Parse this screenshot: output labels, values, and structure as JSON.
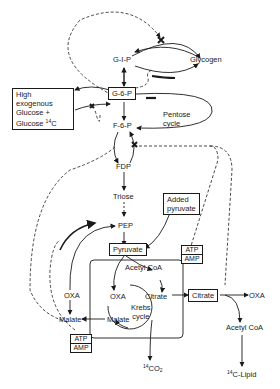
{
  "diagram": {
    "title": "",
    "nodes": {
      "g1p": "G-I-P",
      "glycogen": "Glycogen",
      "g6p": "G-6-P",
      "glucose_box": [
        "High exogenous",
        "Glucose +",
        "Glucose"
      ],
      "glucose_isotope": "14",
      "glucose_isotope_suffix": "C",
      "pentose": [
        "Pentose",
        "cycle"
      ],
      "f6p": "F-6-P",
      "fdp": "FDP",
      "triose": "Triose",
      "pep": "PEP",
      "added_pyruvate": [
        "Added",
        "pyruvate"
      ],
      "pyruvate": "Pyruvate",
      "atp_amp_upper": {
        "numerator": "ATP",
        "denominator": "AMP"
      },
      "acetyl_coa_mito": "Acetyl CoA",
      "oxa_outer": "OXA",
      "oxa_inner": "OXA",
      "citrate_inner": "Citrate",
      "krebs": [
        "Krebs",
        "cycle"
      ],
      "citrate_box": "Citrate",
      "oxa_right": "OXA",
      "malate_outer": "Malate",
      "malate_inner": "Malate",
      "atp_amp_lower": {
        "numerator": "ATP",
        "denominator": "AMP"
      },
      "acetyl_coa_cyto": "Acetyl CoA",
      "co2_isotope": "14",
      "co2": "CO",
      "co2_sub": "2",
      "lipid_isotope": "14",
      "lipid": "C-Lipid"
    },
    "colors": {
      "ink": "#1a1a1a",
      "background": "#ffffff"
    }
  }
}
